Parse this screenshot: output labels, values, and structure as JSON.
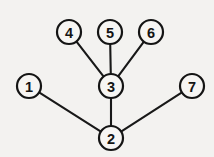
{
  "figure": {
    "background_color": "#f3f2f0",
    "ink_color": "#141414",
    "node_fill_color": "#f6f5f3",
    "width": 214,
    "height": 157
  },
  "chart_data": {
    "type": "diagram",
    "diagram_kind": "node-link-graph",
    "title": "",
    "directed": false,
    "node_radius": 12,
    "nodes": [
      {
        "id": "1",
        "label": "1",
        "x": 29,
        "y": 86
      },
      {
        "id": "2",
        "label": "2",
        "x": 111,
        "y": 138
      },
      {
        "id": "3",
        "label": "3",
        "x": 111,
        "y": 86
      },
      {
        "id": "4",
        "label": "4",
        "x": 69,
        "y": 32
      },
      {
        "id": "5",
        "label": "5",
        "x": 110,
        "y": 32
      },
      {
        "id": "6",
        "label": "6",
        "x": 151,
        "y": 32
      },
      {
        "id": "7",
        "label": "7",
        "x": 192,
        "y": 86
      }
    ],
    "edges": [
      {
        "source": "4",
        "target": "3"
      },
      {
        "source": "5",
        "target": "3"
      },
      {
        "source": "6",
        "target": "3"
      },
      {
        "source": "3",
        "target": "2"
      },
      {
        "source": "1",
        "target": "2"
      },
      {
        "source": "2",
        "target": "7"
      }
    ],
    "node_count": 7,
    "edge_count": 6
  }
}
